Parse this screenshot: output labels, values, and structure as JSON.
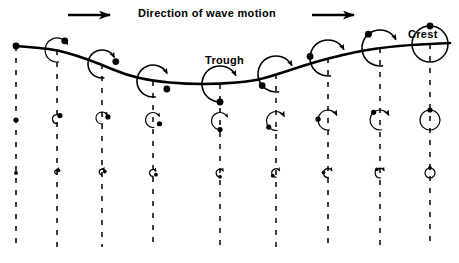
{
  "figure": {
    "title": "Direction of wave motion",
    "type": "wave-orbital-motion-diagram",
    "background_color": "#ffffff",
    "ink_color": "#000000"
  },
  "header": {
    "title": "Direction of wave motion",
    "left_arrow": "arrow-right-icon",
    "right_arrow": "arrow-right-icon",
    "left_arrow_x": 68,
    "left_arrow_y": 15,
    "right_arrow_x": 312,
    "right_arrow_y": 15,
    "arrow_length": 42
  },
  "labels": {
    "crest": "Crest",
    "trough": "Trough"
  },
  "chart_data": {
    "type": "line",
    "title": "Direction of wave motion",
    "xlabel": "",
    "ylabel": "",
    "grid": false,
    "legend": null,
    "annotations": [
      {
        "text": "Crest",
        "x": 430,
        "y": 33
      },
      {
        "text": "Trough",
        "x": 220,
        "y": 60
      },
      {
        "text": "Direction of wave motion",
        "x": 229,
        "y": 13
      }
    ],
    "wave_surface": {
      "name": "wave-profile",
      "description": "One full wavelength: crest at left edge, trough in middle, crest at right edge",
      "stroke_width": 2.6,
      "points": [
        [
          16,
          46
        ],
        [
          40,
          48
        ],
        [
          57,
          50
        ],
        [
          78,
          56
        ],
        [
          100,
          64
        ],
        [
          126,
          75
        ],
        [
          153,
          81
        ],
        [
          186,
          84
        ],
        [
          220,
          84
        ],
        [
          253,
          81
        ],
        [
          272,
          76
        ],
        [
          290,
          70
        ],
        [
          315,
          62
        ],
        [
          342,
          55
        ],
        [
          366,
          50
        ],
        [
          388,
          47
        ],
        [
          410,
          45
        ],
        [
          430,
          44
        ],
        [
          450,
          43
        ]
      ]
    },
    "columns": [
      {
        "id": "col-1",
        "x": 16,
        "dash_top": 46,
        "dash_bottom": 247,
        "surface_y": 46,
        "phase_deg": 0,
        "orbits": [
          {
            "row": "top",
            "cy": 46,
            "radius": 0,
            "dot_r": 3.4,
            "arc": "none",
            "dot_angle_deg": 0
          },
          {
            "row": "middle",
            "cy": 120,
            "radius": 0,
            "dot_r": 2.6,
            "arc": "none",
            "dot_angle_deg": 0
          },
          {
            "row": "bottom",
            "cy": 173,
            "radius": 0,
            "dot_r": 1.9,
            "arc": "none",
            "dot_angle_deg": 0
          }
        ]
      },
      {
        "id": "col-2",
        "x": 57,
        "dash_top": 50,
        "dash_bottom": 247,
        "surface_y": 50,
        "phase_deg": 40,
        "orbits": [
          {
            "row": "top",
            "cy": 50,
            "radius": 12,
            "dot_r": 3.4,
            "arc": "open",
            "dot_angle_deg": 40
          },
          {
            "row": "middle",
            "cy": 119,
            "radius": 4.5,
            "dot_r": 2.6,
            "arc": "open",
            "dot_angle_deg": 40
          },
          {
            "row": "bottom",
            "cy": 172,
            "radius": 2.2,
            "dot_r": 1.9,
            "arc": "open",
            "dot_angle_deg": 40
          }
        ]
      },
      {
        "id": "col-3",
        "x": 102,
        "dash_top": 64,
        "dash_bottom": 247,
        "surface_y": 64,
        "phase_deg": 80,
        "orbits": [
          {
            "row": "top",
            "cy": 64,
            "radius": 14,
            "dot_r": 3.4,
            "arc": "open",
            "dot_angle_deg": 80
          },
          {
            "row": "middle",
            "cy": 118,
            "radius": 6,
            "dot_r": 2.6,
            "arc": "open",
            "dot_angle_deg": 80
          },
          {
            "row": "bottom",
            "cy": 172,
            "radius": 2.8,
            "dot_r": 1.9,
            "arc": "open",
            "dot_angle_deg": 80
          }
        ]
      },
      {
        "id": "col-4",
        "x": 153,
        "dash_top": 81,
        "dash_bottom": 247,
        "surface_y": 81,
        "phase_deg": 120,
        "orbits": [
          {
            "row": "top",
            "cy": 81,
            "radius": 16,
            "dot_r": 3.4,
            "arc": "open",
            "dot_angle_deg": 120
          },
          {
            "row": "middle",
            "cy": 120,
            "radius": 7.5,
            "dot_r": 2.6,
            "arc": "open",
            "dot_angle_deg": 120
          },
          {
            "row": "bottom",
            "cy": 173,
            "radius": 3.4,
            "dot_r": 1.9,
            "arc": "open",
            "dot_angle_deg": 120
          }
        ]
      },
      {
        "id": "col-5",
        "x": 220,
        "dash_top": 84,
        "dash_bottom": 247,
        "surface_y": 84,
        "phase_deg": 180,
        "orbits": [
          {
            "row": "top",
            "cy": 84,
            "radius": 18,
            "dot_r": 3.4,
            "arc": "open",
            "dot_angle_deg": 180
          },
          {
            "row": "middle",
            "cy": 121,
            "radius": 8.5,
            "dot_r": 2.6,
            "arc": "open",
            "dot_angle_deg": 180
          },
          {
            "row": "bottom",
            "cy": 173,
            "radius": 3.8,
            "dot_r": 1.9,
            "arc": "open",
            "dot_angle_deg": 180
          }
        ]
      },
      {
        "id": "col-6",
        "x": 276,
        "dash_top": 74,
        "dash_bottom": 247,
        "surface_y": 74,
        "phase_deg": 230,
        "orbits": [
          {
            "row": "top",
            "cy": 74,
            "radius": 18,
            "dot_r": 3.4,
            "arc": "open",
            "dot_angle_deg": 230
          },
          {
            "row": "middle",
            "cy": 121,
            "radius": 9.5,
            "dot_r": 2.6,
            "arc": "open",
            "dot_angle_deg": 230
          },
          {
            "row": "bottom",
            "cy": 173,
            "radius": 4.2,
            "dot_r": 1.9,
            "arc": "open",
            "dot_angle_deg": 230
          }
        ]
      },
      {
        "id": "col-7",
        "x": 328,
        "dash_top": 58,
        "dash_bottom": 247,
        "surface_y": 58,
        "phase_deg": 275,
        "orbits": [
          {
            "row": "top",
            "cy": 58,
            "radius": 18,
            "dot_r": 3.4,
            "arc": "open",
            "dot_angle_deg": 275
          },
          {
            "row": "middle",
            "cy": 120,
            "radius": 10,
            "dot_r": 2.6,
            "arc": "open",
            "dot_angle_deg": 275
          },
          {
            "row": "bottom",
            "cy": 173,
            "radius": 4.5,
            "dot_r": 1.9,
            "arc": "open",
            "dot_angle_deg": 275
          }
        ]
      },
      {
        "id": "col-8",
        "x": 380,
        "dash_top": 48,
        "dash_bottom": 247,
        "surface_y": 48,
        "phase_deg": 320,
        "orbits": [
          {
            "row": "top",
            "cy": 48,
            "radius": 18,
            "dot_r": 3.4,
            "arc": "open",
            "dot_angle_deg": 320
          },
          {
            "row": "middle",
            "cy": 120,
            "radius": 10,
            "dot_r": 2.6,
            "arc": "open",
            "dot_angle_deg": 320
          },
          {
            "row": "bottom",
            "cy": 173,
            "radius": 4.8,
            "dot_r": 1.9,
            "arc": "open",
            "dot_angle_deg": 320
          }
        ]
      },
      {
        "id": "col-9",
        "x": 430,
        "dash_top": 44,
        "dash_bottom": 247,
        "surface_y": 44,
        "phase_deg": 360,
        "orbits": [
          {
            "row": "top",
            "cy": 44,
            "radius": 18,
            "dot_r": 3.4,
            "arc": "closed",
            "dot_angle_deg": 360
          },
          {
            "row": "middle",
            "cy": 120,
            "radius": 10,
            "dot_r": 2.6,
            "arc": "closed",
            "dot_angle_deg": 360
          },
          {
            "row": "bottom",
            "cy": 173,
            "radius": 5,
            "dot_r": 1.9,
            "arc": "closed",
            "dot_angle_deg": 360
          }
        ]
      }
    ]
  }
}
